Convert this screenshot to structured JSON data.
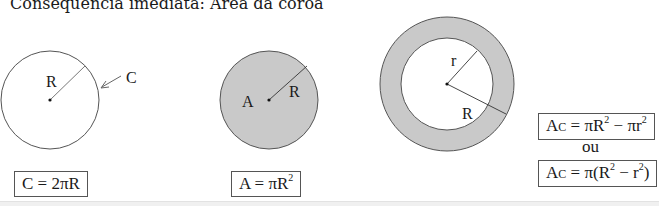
{
  "title": "Consequência imediata: Área da coroa",
  "figures": {
    "circumference": {
      "label_radius": "R",
      "label_curve": "C",
      "formula": {
        "lhs": "C",
        "eq": " = 2πR"
      }
    },
    "area": {
      "label_area": "A",
      "label_radius": "R",
      "formula": {
        "lhs": "A = πR",
        "exp": "2"
      }
    },
    "annulus": {
      "label_inner_radius": "r",
      "label_outer_radius": "R"
    },
    "annulus_formulas": {
      "f1": {
        "a": "A",
        "sub": "C",
        "mid": " = πR",
        "exp1": "2",
        "minus": " − πr",
        "exp2": "2"
      },
      "separator": "ou",
      "f2": {
        "a": "A",
        "sub": "C",
        "mid": " = π(R",
        "exp1": "2",
        "minus": " − r",
        "exp2": "2",
        "close": ")"
      }
    }
  },
  "colors": {
    "fill": "#c9c9c9",
    "stroke": "#555555"
  }
}
